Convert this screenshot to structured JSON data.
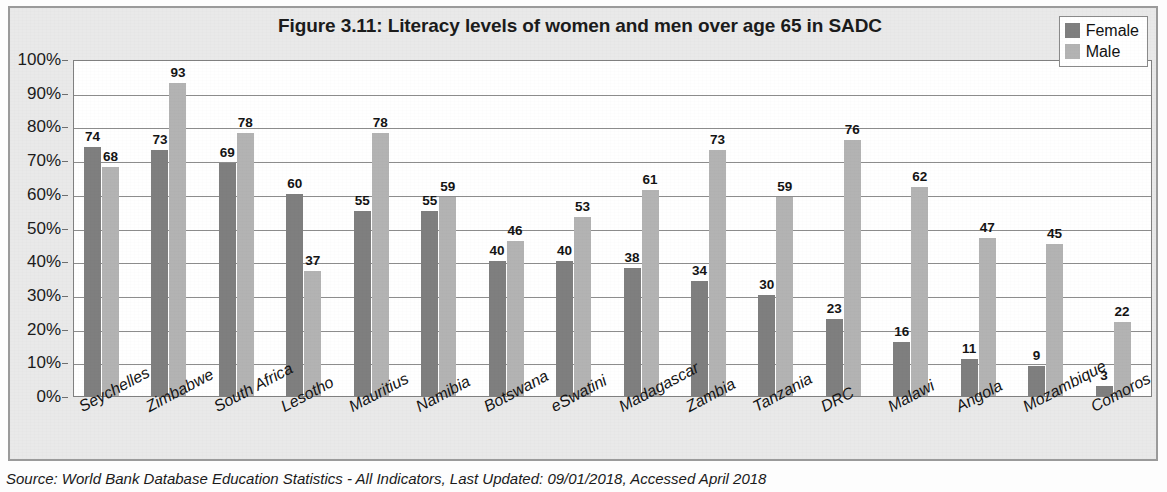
{
  "figure": {
    "title": "Figure 3.11: Literacy levels of women and men over age 65 in SADC",
    "source": "Source: World Bank Database Education Statistics - All Indicators, Last Updated: 09/01/2018, Accessed April 2018"
  },
  "legend": {
    "position": "top-right",
    "items": [
      {
        "label": "Female",
        "color": "#7f7f7f"
      },
      {
        "label": "Male",
        "color": "#b3b3b3"
      }
    ]
  },
  "chart_data": {
    "type": "bar",
    "title": "Figure 3.11: Literacy levels of women and men over age 65 in SADC",
    "xlabel": "",
    "ylabel": "",
    "ylim": [
      0,
      100
    ],
    "grid": true,
    "legend_position": "top-right",
    "y_ticks": [
      "0%",
      "10%",
      "20%",
      "30%",
      "40%",
      "50%",
      "60%",
      "70%",
      "80%",
      "90%",
      "100%"
    ],
    "y_tick_values": [
      0,
      10,
      20,
      30,
      40,
      50,
      60,
      70,
      80,
      90,
      100
    ],
    "categories": [
      "Seychelles",
      "Zimbabwe",
      "South Africa",
      "Lesotho",
      "Mauritius",
      "Namibia",
      "Botswana",
      "eSwatini",
      "Madagascar",
      "Zambia",
      "Tanzania",
      "DRC",
      "Malawi",
      "Angola",
      "Mozambique",
      "Comoros"
    ],
    "series": [
      {
        "name": "Female",
        "color": "#7f7f7f",
        "values": [
          74,
          73,
          69,
          60,
          55,
          55,
          40,
          40,
          38,
          34,
          30,
          23,
          16,
          11,
          9,
          3
        ]
      },
      {
        "name": "Male",
        "color": "#b3b3b3",
        "values": [
          68,
          93,
          78,
          37,
          78,
          59,
          46,
          53,
          61,
          73,
          59,
          76,
          62,
          47,
          45,
          22
        ]
      }
    ]
  }
}
